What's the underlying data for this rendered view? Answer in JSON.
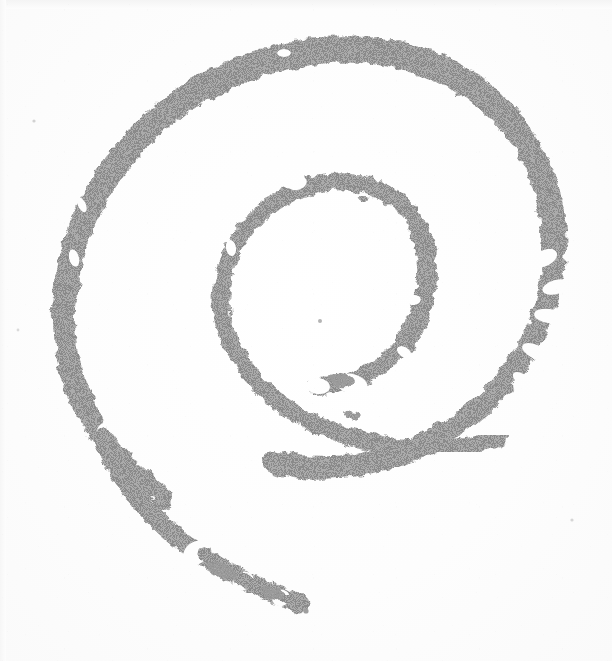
{
  "image": {
    "subject": "spiral-swirl-mark",
    "description": "Hand-drawn spiral (swirl) mark, scanned with halftone dither",
    "orientation": "open-tail-toward-lower-left",
    "width": 612,
    "height": 661,
    "background_color": "#fdfdfd",
    "paper_tone": "#fafafa",
    "stroke_color": "#969696",
    "stroke_color_dark": "#8c8c8c",
    "stroke_color_light": "#a8a8a8",
    "turn_count": "2",
    "texture": "dithered-halftone",
    "caption": ""
  },
  "geometry": {
    "outer_turn": {
      "name": "outer-spiral-arc",
      "center_x": 300,
      "center_y": 320,
      "radius_x": 238,
      "radius_y": 262,
      "stroke_width": 22,
      "start_angle_deg": 118,
      "end_angle_deg": 430
    },
    "inner_turn": {
      "name": "inner-spiral-arc",
      "center_x": 320,
      "center_y": 300,
      "radius_x": 108,
      "radius_y": 118,
      "stroke_width": 17,
      "start_angle_deg": 150,
      "end_angle_deg": 430
    },
    "tail": {
      "name": "spiral-tail",
      "start_x": 160,
      "start_y": 490,
      "end_x": 310,
      "end_y": 612,
      "dash_count": "3"
    },
    "center_speck": {
      "x": 320,
      "y": 321,
      "radius": 2
    },
    "holes": [
      {
        "name": "stroke-hole-top",
        "x": 284,
        "y": 53,
        "rx": 7,
        "ry": 4
      },
      {
        "name": "stroke-hole-left-upper",
        "x": 96,
        "y": 317,
        "rx": 5,
        "ry": 4
      },
      {
        "name": "stroke-hole-left-lower",
        "x": 95,
        "y": 371,
        "rx": 5,
        "ry": 5
      },
      {
        "name": "stroke-hole-tail",
        "x": 121,
        "y": 464,
        "rx": 3,
        "ry": 3
      },
      {
        "name": "stroke-hole-inner-eye",
        "x": 381,
        "y": 241,
        "rx": 10,
        "ry": 9
      }
    ],
    "specks": [
      {
        "name": "speck-top",
        "x": 307,
        "y": 42,
        "r": 2
      },
      {
        "name": "speck-inner-upper",
        "x": 363,
        "y": 200,
        "r": 3
      },
      {
        "name": "speck-inner-center",
        "x": 320,
        "y": 321,
        "r": 2
      },
      {
        "name": "speck-tail-tip",
        "x": 306,
        "y": 611,
        "r": 3
      },
      {
        "name": "speck-tail-mid",
        "x": 246,
        "y": 586,
        "r": 2
      }
    ]
  },
  "palette": {
    "ink": "#969696",
    "ink_dark": "#8a8a8a",
    "ink_light": "#ababab",
    "paper": "#fdfdfd",
    "paper_edge": "#f4f4f4"
  }
}
